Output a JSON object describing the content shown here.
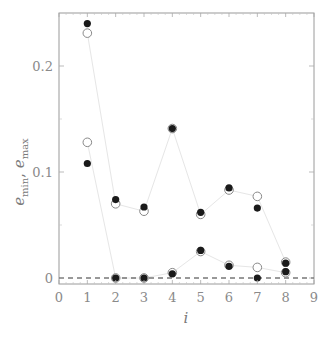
{
  "chart_data": {
    "type": "scatter",
    "title": "",
    "xlabel": "i",
    "ylabel": "e_min, e_max",
    "xlim": [
      0,
      9
    ],
    "ylim": [
      -0.005,
      0.26
    ],
    "x_ticks": [
      0,
      1,
      2,
      3,
      4,
      5,
      6,
      7,
      8,
      9
    ],
    "x_tick_labels": [
      "0",
      "1",
      "2",
      "3",
      "4",
      "5",
      "6",
      "7",
      "8",
      "9"
    ],
    "y_ticks": [
      0,
      0.1,
      0.2
    ],
    "y_tick_labels": [
      "0",
      "0.1",
      "0.2"
    ],
    "grid": false,
    "legend": null,
    "reference_line": {
      "y": 0,
      "style": "dashed",
      "color": "#333333"
    },
    "series": [
      {
        "name": "e_max (filled)",
        "marker": "filled-circle",
        "color": "#1a1a1a",
        "x": [
          1,
          2,
          3,
          4,
          5,
          6,
          7,
          8
        ],
        "values": [
          0.24,
          0.074,
          0.067,
          0.141,
          0.062,
          0.085,
          0.066,
          0.014
        ]
      },
      {
        "name": "e_max (open)",
        "marker": "open-circle",
        "color": "#888888",
        "line_color": "#e6e6e6",
        "x": [
          1,
          2,
          3,
          4,
          5,
          6,
          7,
          8
        ],
        "values": [
          0.231,
          0.07,
          0.063,
          0.141,
          0.06,
          0.083,
          0.077,
          0.015
        ]
      },
      {
        "name": "e_min (filled)",
        "marker": "filled-circle",
        "color": "#1a1a1a",
        "x": [
          1,
          2,
          3,
          4,
          5,
          6,
          7,
          8
        ],
        "values": [
          0.108,
          0.0,
          0.0,
          0.004,
          0.026,
          0.011,
          0.0,
          0.006
        ]
      },
      {
        "name": "e_min (open)",
        "marker": "open-circle",
        "color": "#888888",
        "line_color": "#e6e6e6",
        "x": [
          1,
          2,
          3,
          4,
          5,
          6,
          7,
          8
        ],
        "values": [
          0.128,
          0.0,
          0.0,
          0.005,
          0.025,
          0.012,
          0.01,
          0.005
        ]
      }
    ]
  },
  "labels": {
    "xlabel": "i",
    "ylabel_base1": "e",
    "ylabel_sub1": "min",
    "ylabel_sep": ", ",
    "ylabel_base2": "e",
    "ylabel_sub2": "max"
  }
}
